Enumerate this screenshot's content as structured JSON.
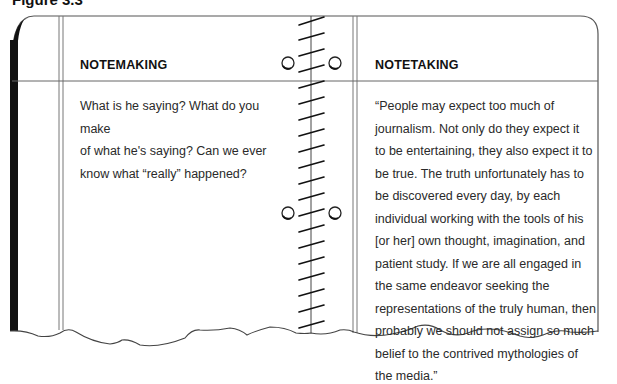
{
  "figure": {
    "caption": "Figure 3.3"
  },
  "left_page": {
    "heading": "NOTEMAKING",
    "text": "What is he saying? What do you make\nof what he's saying? Can we ever\nknow what “really” happened?"
  },
  "right_page": {
    "heading": "NOTETAKING",
    "text": "“People may expect too much of\njournalism. Not only do they expect it\nto be entertaining, they also expect it to\nbe true. The truth unfortunately has to\nbe discovered every day, by each\nindividual working with the tools of his\n[or her] own thought, imagination, and\npatient study. If we are all engaged in\nthe same endeavor seeking the\nrepresentations of the truly human, then\nprobably we should not assign so much\nbelief to the contrived mythologies of\nthe media.”"
  },
  "binding": {
    "type": "spiral",
    "rings": 2,
    "coil_marks": 26
  },
  "colors": {
    "ink": "#111111",
    "line": "#555555",
    "paper": "#ffffff"
  }
}
